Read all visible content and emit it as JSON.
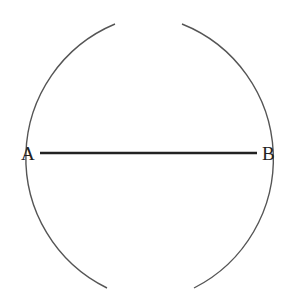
{
  "diagram": {
    "points": [
      {
        "label": "A",
        "x": 40,
        "y": 153
      },
      {
        "label": "B",
        "x": 257,
        "y": 153
      }
    ],
    "segment": {
      "from": "A",
      "to": "B"
    },
    "arcs": [
      {
        "center": "B",
        "description": "arc drawn from B, crossing segment left of midpoint"
      },
      {
        "center": "A",
        "description": "arc drawn from A, crossing segment right of midpoint"
      }
    ],
    "colors": {
      "line": "#222222",
      "arc": "#555555",
      "background": "#ffffff"
    }
  }
}
